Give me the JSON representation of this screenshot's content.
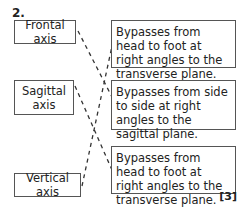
{
  "question": {
    "number": "2.",
    "marks": "[3]"
  },
  "left_boxes": [
    {
      "label": "Frontal axis"
    },
    {
      "label": "Sagittal axis"
    },
    {
      "label": "Vertical axis"
    }
  ],
  "right_boxes": [
    {
      "text": "Bypasses from head to foot at right angles to the transverse plane."
    },
    {
      "text": "Bypasses from side to side at right angles to the sagittal plane."
    },
    {
      "text": "Bypasses from head to foot at right angles to the transverse plane."
    }
  ],
  "connections": [
    {
      "from": "Frontal axis",
      "to": 2
    },
    {
      "from": "Sagittal axis",
      "to": 3
    },
    {
      "from": "Vertical axis",
      "to": 1
    }
  ]
}
